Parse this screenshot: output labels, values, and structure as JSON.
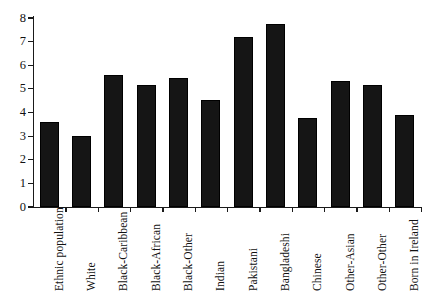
{
  "chart_data": {
    "type": "bar",
    "title": "",
    "subtitle": "",
    "xlabel": "",
    "ylabel": "",
    "categories": [
      "Ethnic population",
      "White",
      "Black-Caribbean",
      "Black-African",
      "Black-Other",
      "Indian",
      "Pakistani",
      "Bangladeshi",
      "Chinese",
      "Other-Asian",
      "Other-Other",
      "Born in Ireland"
    ],
    "values": [
      3.6,
      3.0,
      5.6,
      5.15,
      5.45,
      4.55,
      7.2,
      7.75,
      3.75,
      5.35,
      5.15,
      3.9
    ],
    "ylim": [
      0,
      8
    ],
    "yticks": [
      0,
      1,
      2,
      3,
      4,
      5,
      6,
      7,
      8
    ],
    "ytick_labels": [
      "0",
      "1",
      "2",
      "3",
      "4",
      "5",
      "6",
      "7",
      "8"
    ],
    "grid": false,
    "legend": null,
    "bar_color": "#151515",
    "axis_color": "#1a1a1a",
    "background_color": "#ffffff"
  }
}
